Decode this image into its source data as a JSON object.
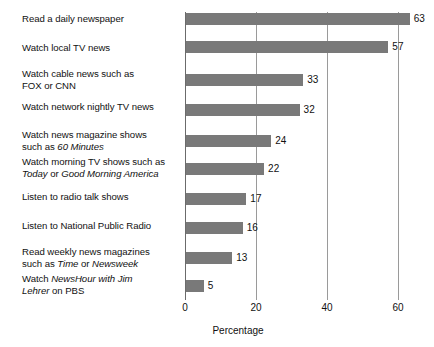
{
  "chart_data": {
    "type": "bar",
    "orientation": "horizontal",
    "title": "",
    "xlabel": "Percentage",
    "ylabel": "",
    "xlim": [
      0,
      65
    ],
    "xticks": [
      0,
      20,
      40,
      60
    ],
    "grid": "vertical",
    "legend": "none",
    "bar_color": "#797979",
    "categories": [
      "Read a daily newspaper",
      "Watch local TV news",
      "Watch cable news such as FOX or CNN",
      "Watch network nightly TV news",
      "Watch news magazine shows such as 60 Minutes",
      "Watch morning TV shows such as Today or Good Morning America",
      "Listen to radio talk shows",
      "Listen to National Public Radio",
      "Read weekly news magazines such as Time or Newsweek",
      "Watch NewsHour with Jim Lehrer on PBS"
    ],
    "values": [
      63,
      57,
      33,
      32,
      24,
      22,
      17,
      16,
      13,
      5
    ]
  },
  "labels": [
    {
      "id": "read-daily-newspaper",
      "lines": [
        [
          {
            "t": "Read a daily newspaper",
            "i": false
          }
        ]
      ]
    },
    {
      "id": "watch-local-tv-news",
      "lines": [
        [
          {
            "t": "Watch local TV news",
            "i": false
          }
        ]
      ]
    },
    {
      "id": "watch-cable-news",
      "lines": [
        [
          {
            "t": "Watch cable news such as",
            "i": false
          }
        ],
        [
          {
            "t": "FOX or CNN",
            "i": false
          }
        ]
      ]
    },
    {
      "id": "watch-network-nightly-tv-news",
      "lines": [
        [
          {
            "t": "Watch network nightly TV news",
            "i": false
          }
        ]
      ]
    },
    {
      "id": "watch-news-magazine-shows",
      "lines": [
        [
          {
            "t": "Watch news magazine shows",
            "i": false
          }
        ],
        [
          {
            "t": "such as ",
            "i": false
          },
          {
            "t": "60 Minutes",
            "i": true
          }
        ]
      ]
    },
    {
      "id": "watch-morning-tv-shows",
      "lines": [
        [
          {
            "t": "Watch morning TV shows such as",
            "i": false
          }
        ],
        [
          {
            "t": "Today",
            "i": true
          },
          {
            "t": " or ",
            "i": false
          },
          {
            "t": "Good Morning America",
            "i": true
          }
        ]
      ]
    },
    {
      "id": "listen-to-radio-talk-shows",
      "lines": [
        [
          {
            "t": "Listen to radio talk shows",
            "i": false
          }
        ]
      ]
    },
    {
      "id": "listen-to-national-public-radio",
      "lines": [
        [
          {
            "t": "Listen to National Public Radio",
            "i": false
          }
        ]
      ]
    },
    {
      "id": "read-weekly-news-magazines",
      "lines": [
        [
          {
            "t": "Read weekly news magazines",
            "i": false
          }
        ],
        [
          {
            "t": "such as ",
            "i": false
          },
          {
            "t": "Time",
            "i": true
          },
          {
            "t": " or ",
            "i": false
          },
          {
            "t": "Newsweek",
            "i": true
          }
        ]
      ]
    },
    {
      "id": "watch-newshour",
      "lines": [
        [
          {
            "t": "Watch ",
            "i": false
          },
          {
            "t": "NewsHour with Jim",
            "i": true
          }
        ],
        [
          {
            "t": "Lehrer",
            "i": true
          },
          {
            "t": " on PBS",
            "i": false
          }
        ]
      ]
    }
  ],
  "geometry": {
    "bar_tops": [
      13,
      41,
      74,
      104,
      135,
      163,
      193,
      222,
      252,
      280
    ],
    "label_tops": [
      13,
      42,
      68,
      101,
      129,
      156,
      191,
      220,
      246,
      273
    ],
    "plot_left": 185,
    "plot_top": 12,
    "plot_height": 288,
    "px_per_unit": 3.55
  }
}
